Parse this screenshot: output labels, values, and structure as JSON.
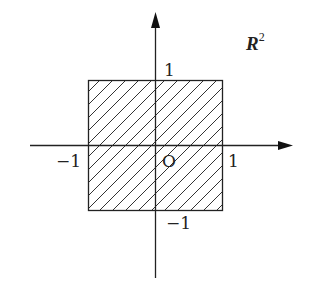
{
  "diagram": {
    "title_label": {
      "base": "R",
      "exponent": "2"
    },
    "axes": {
      "origin_label": "O",
      "x_positive_tick": "1",
      "x_negative_tick": "−1",
      "y_positive_tick": "1",
      "y_negative_tick": "−1"
    },
    "region": {
      "shape": "square",
      "x_range": [
        -1,
        1
      ],
      "y_range": [
        -1,
        1
      ],
      "fill": "diagonal-hatch"
    },
    "colors": {
      "stroke": "#222222",
      "hatch": "#333333",
      "background": "#ffffff"
    }
  }
}
